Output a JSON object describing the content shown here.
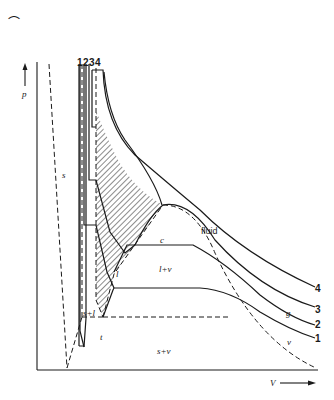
{
  "figure": {
    "type": "p-V phase diagram",
    "axes": {
      "y_label": "p",
      "x_label": "V"
    },
    "regions": {
      "solid": "s",
      "solid_liquid": "s+l",
      "liquid": "l",
      "liquid_vapour": "l+v",
      "solid_vapour": "s+v",
      "fluid": "fluid",
      "gas": "g",
      "vapour": "v"
    },
    "points": {
      "critical": "c",
      "triple": "t"
    },
    "isotherms": {
      "top_labels": [
        "1",
        "2",
        "3",
        "4"
      ],
      "right_labels": [
        "4",
        "3",
        "2",
        "1"
      ]
    },
    "corner_mark": "⌒"
  }
}
